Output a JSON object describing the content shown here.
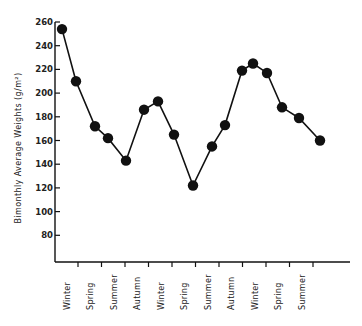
{
  "chart_data": {
    "type": "line",
    "title": "",
    "xlabel": "",
    "ylabel": "Bimonthly Average Weights (g/m²)",
    "ylim": [
      60,
      260
    ],
    "yticks": [
      80,
      100,
      120,
      140,
      160,
      180,
      200,
      220,
      240,
      260
    ],
    "grid": false,
    "legend": null,
    "season_labels": [
      "Winter",
      "Spring",
      "Summer",
      "Autumn",
      "Winter",
      "Spring",
      "Summer",
      "Autumn",
      "Winter",
      "Spring",
      "Summer"
    ],
    "series": [
      {
        "name": "Bimonthly Average Weights",
        "marker": "filled-circle",
        "color": "#111111",
        "x_index": [
          0,
          1,
          2,
          3,
          4,
          5,
          6,
          7,
          8,
          9,
          10,
          11,
          12,
          13,
          14,
          15,
          16
        ],
        "values": [
          254,
          210,
          172,
          162,
          143,
          186,
          193,
          165,
          122,
          155,
          173,
          219,
          225,
          217,
          188,
          179,
          160
        ]
      }
    ]
  },
  "axes": {
    "y_title": "Bimonthly Average Weights (g/m²)"
  }
}
